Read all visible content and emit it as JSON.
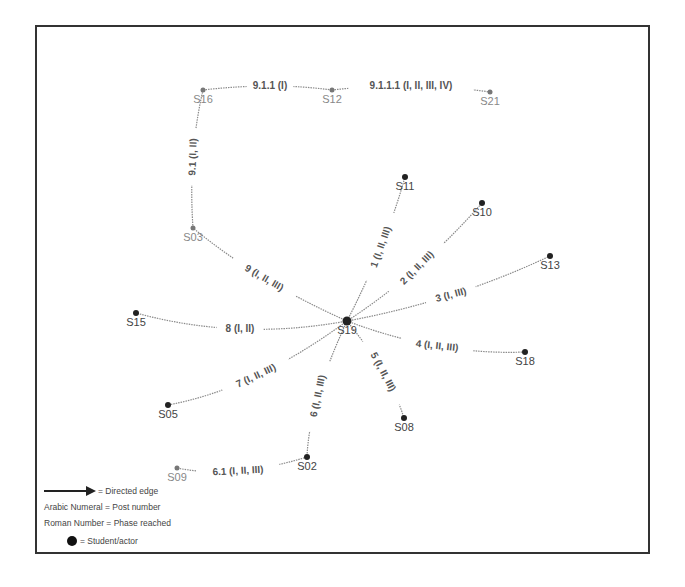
{
  "diagram": {
    "type": "directed-network",
    "nodes": [
      {
        "id": "S16",
        "x": 203,
        "y": 90,
        "style": "grey"
      },
      {
        "id": "S12",
        "x": 332,
        "y": 90,
        "style": "grey"
      },
      {
        "id": "S21",
        "x": 490,
        "y": 92,
        "style": "grey"
      },
      {
        "id": "S03",
        "x": 193,
        "y": 228,
        "style": "grey"
      },
      {
        "id": "S11",
        "x": 405,
        "y": 177,
        "style": "dark"
      },
      {
        "id": "S10",
        "x": 482,
        "y": 203,
        "style": "dark"
      },
      {
        "id": "S13",
        "x": 550,
        "y": 256,
        "style": "dark"
      },
      {
        "id": "S15",
        "x": 136,
        "y": 313,
        "style": "dark"
      },
      {
        "id": "S19",
        "x": 347,
        "y": 321,
        "style": "hub"
      },
      {
        "id": "S18",
        "x": 525,
        "y": 352,
        "style": "dark"
      },
      {
        "id": "S05",
        "x": 168,
        "y": 405,
        "style": "dark"
      },
      {
        "id": "S08",
        "x": 404,
        "y": 418,
        "style": "dark"
      },
      {
        "id": "S02",
        "x": 307,
        "y": 457,
        "style": "dark"
      },
      {
        "id": "S09",
        "x": 177,
        "y": 468,
        "style": "grey"
      }
    ],
    "edges": [
      {
        "from": "S19",
        "to": "S11",
        "label": "1 (I, II, III)",
        "lx": 381,
        "ly": 247,
        "angle": -70
      },
      {
        "from": "S19",
        "to": "S10",
        "label": "2 (I, II, III)",
        "lx": 417,
        "ly": 268,
        "angle": -45
      },
      {
        "from": "S19",
        "to": "S13",
        "label": "3 (I, III)",
        "lx": 451,
        "ly": 295,
        "angle": -15
      },
      {
        "from": "S19",
        "to": "S18",
        "label": "4 (I, II, III)",
        "lx": 437,
        "ly": 346,
        "angle": 6
      },
      {
        "from": "S19",
        "to": "S08",
        "label": "5 (I, II, III)",
        "lx": 383,
        "ly": 372,
        "angle": 62
      },
      {
        "from": "S19",
        "to": "S02",
        "label": "6 (I, II, III)",
        "lx": 318,
        "ly": 396,
        "angle": -78
      },
      {
        "from": "S02",
        "to": "S09",
        "label": "6.1 (I, II, III)",
        "lx": 238,
        "ly": 471,
        "angle": -3
      },
      {
        "from": "S19",
        "to": "S05",
        "label": "7 (I, II, III)",
        "lx": 256,
        "ly": 376,
        "angle": -25
      },
      {
        "from": "S19",
        "to": "S15",
        "label": "8 (I, II)",
        "lx": 240,
        "ly": 329,
        "angle": 0
      },
      {
        "from": "S19",
        "to": "S03",
        "label": "9 (I, II, III)",
        "lx": 264,
        "ly": 278,
        "angle": 30
      },
      {
        "from": "S03",
        "to": "S16",
        "label": "9.1 (I, II)",
        "lx": 193,
        "ly": 157,
        "angle": -88
      },
      {
        "from": "S16",
        "to": "S12",
        "label": "9.1.1 (I)",
        "lx": 270,
        "ly": 86,
        "angle": 0
      },
      {
        "from": "S12",
        "to": "S21",
        "label": "9.1.1.1 (I, II, III, IV)",
        "lx": 411,
        "ly": 86,
        "angle": 0
      }
    ]
  },
  "legend": {
    "directed_edge": "= Directed edge",
    "arabic": "Arabic Numeral = Post number",
    "roman": "Roman Number = Phase reached",
    "actor": "= Student/actor"
  },
  "colors": {
    "frame": "#333333",
    "edge": "#8a8a8a",
    "node": "#222222",
    "grey_node": "#777777"
  }
}
